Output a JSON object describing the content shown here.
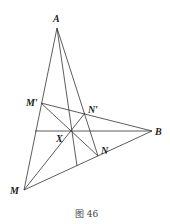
{
  "figure": {
    "caption": "图 46",
    "points": {
      "A": {
        "label": "A",
        "x": 57,
        "y": 28
      },
      "B": {
        "label": "B",
        "x": 152,
        "y": 131
      },
      "M": {
        "label": "M",
        "x": 24,
        "y": 190
      },
      "M_prime": {
        "label": "M′",
        "x": 41,
        "y": 103
      },
      "N_prime": {
        "label": "N′",
        "x": 85,
        "y": 113
      },
      "N": {
        "label": "N",
        "x": 98,
        "y": 156
      },
      "X": {
        "label": "X",
        "x": 71,
        "y": 131
      }
    },
    "segments": [
      "A-M",
      "A-N",
      "M-B",
      "M'-B",
      "M'-N",
      "M-N'",
      "A-foot",
      "horizontal-X-B"
    ]
  }
}
